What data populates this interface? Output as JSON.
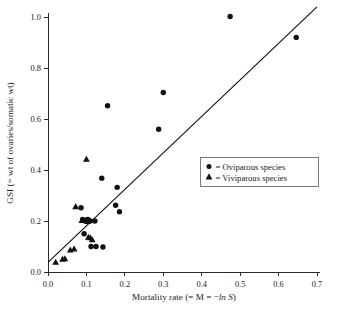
{
  "chart_data": {
    "type": "scatter",
    "title": "",
    "xlabel": "Mortality rate (= M = −ln S)",
    "ylabel": "GSI (= wt of ovaries/somatic wt)",
    "xlim": [
      0.0,
      0.7
    ],
    "ylim": [
      0.0,
      1.0
    ],
    "xticks": [
      0.0,
      0.1,
      0.2,
      0.3,
      0.4,
      0.5,
      0.6,
      0.7
    ],
    "xtick_labels": [
      "0.0",
      "0.1",
      "0.2",
      "0.3",
      "0.4",
      "0.5",
      "0.6",
      "0.7"
    ],
    "yticks": [
      0.0,
      0.2,
      0.4,
      0.6,
      0.8,
      1.0
    ],
    "ytick_labels": [
      "0.0",
      "0.2",
      "0.4",
      "0.6",
      "0.8",
      "1.0"
    ],
    "grid": false,
    "legend_position": "center-right",
    "marker_color": "#111111",
    "line_color": "#111111",
    "series": [
      {
        "name": "Oviparous species",
        "marker": "circle",
        "legend_label": "= Oviparous species",
        "points": [
          [
            0.086,
            0.252
          ],
          [
            0.09,
            0.206
          ],
          [
            0.094,
            0.15
          ],
          [
            0.1,
            0.204
          ],
          [
            0.102,
            0.198
          ],
          [
            0.104,
            0.206
          ],
          [
            0.11,
            0.2
          ],
          [
            0.112,
            0.1
          ],
          [
            0.122,
            0.2
          ],
          [
            0.125,
            0.1
          ],
          [
            0.14,
            0.368
          ],
          [
            0.143,
            0.098
          ],
          [
            0.155,
            0.652
          ],
          [
            0.176,
            0.262
          ],
          [
            0.18,
            0.332
          ],
          [
            0.186,
            0.236
          ],
          [
            0.288,
            0.56
          ],
          [
            0.3,
            0.704
          ],
          [
            0.474,
            1.002
          ],
          [
            0.646,
            0.92
          ]
        ]
      },
      {
        "name": "Viviparous species",
        "marker": "triangle",
        "legend_label": "= Viviparous species",
        "points": [
          [
            0.02,
            0.04
          ],
          [
            0.038,
            0.052
          ],
          [
            0.044,
            0.054
          ],
          [
            0.058,
            0.088
          ],
          [
            0.068,
            0.092
          ],
          [
            0.072,
            0.258
          ],
          [
            0.088,
            0.204
          ],
          [
            0.1,
            0.444
          ],
          [
            0.102,
            0.2
          ],
          [
            0.105,
            0.138
          ],
          [
            0.11,
            0.136
          ],
          [
            0.115,
            0.128
          ]
        ]
      }
    ],
    "fit_line": {
      "name": "regression-line",
      "x_start": 0.0,
      "y_start": 0.038,
      "x_end": 0.7,
      "y_end": 1.04
    }
  },
  "legend": {
    "items": [
      {
        "marker": "circle",
        "label": "= Oviparous species"
      },
      {
        "marker": "triangle",
        "label": "= Viviparous species"
      }
    ]
  },
  "axis": {
    "x_title_plain_1": "Mortality rate (= M = −",
    "x_title_italic": "ln S",
    "x_title_plain_2": ")",
    "y_title": "GSI (= wt of ovaries/somatic wt)"
  }
}
